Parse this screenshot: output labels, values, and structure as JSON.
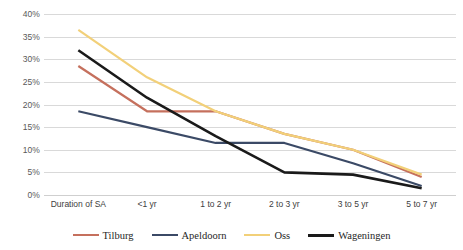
{
  "chart_data": {
    "type": "line",
    "title": "",
    "xlabel": "",
    "ylabel": "",
    "categories": [
      "Duration of SA",
      "<1 yr",
      "1 to 2 yr",
      "2 to 3 yr",
      "3 to 5 yr",
      "5 to 7 yr"
    ],
    "ylim": [
      0,
      40
    ],
    "ytick_labels": [
      "0%",
      "5%",
      "10%",
      "15%",
      "20%",
      "25%",
      "30%",
      "35%",
      "40%"
    ],
    "ytick_values": [
      0,
      5,
      10,
      15,
      20,
      25,
      30,
      35,
      40
    ],
    "grid": true,
    "legend_position": "bottom",
    "series": [
      {
        "name": "Tilburg",
        "color": "#C5705D",
        "values": [
          28.5,
          18.5,
          18.5,
          13.5,
          10.0,
          4.0
        ]
      },
      {
        "name": "Apeldoorn",
        "color": "#3B4A66",
        "values": [
          18.5,
          15.0,
          11.5,
          11.5,
          7.0,
          2.0
        ]
      },
      {
        "name": "Oss",
        "color": "#F2D079",
        "values": [
          36.5,
          26.0,
          18.5,
          13.5,
          10.0,
          4.5
        ]
      },
      {
        "name": "Wageningen",
        "color": "#1A1A1A",
        "values": [
          32.0,
          21.5,
          13.0,
          5.0,
          4.5,
          1.5
        ]
      }
    ]
  }
}
